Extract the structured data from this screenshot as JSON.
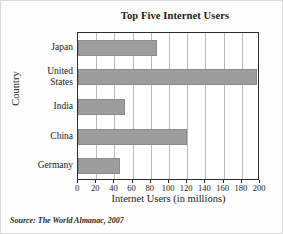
{
  "chart_data": {
    "type": "bar",
    "orientation": "horizontal",
    "title": "Top Five Internet Users",
    "xlabel": "Internet Users (in millions)",
    "ylabel": "Country",
    "categories": [
      "Japan",
      "United States",
      "India",
      "China",
      "Germany"
    ],
    "values": [
      87,
      197,
      52,
      120,
      46
    ],
    "xlim": [
      0,
      200
    ],
    "xticks": [
      0,
      20,
      40,
      60,
      80,
      100,
      120,
      140,
      160,
      180,
      200
    ],
    "xtick_labels": [
      "0",
      "20",
      "40",
      "60",
      "80",
      "100",
      "120",
      "140",
      "160",
      "180",
      "200"
    ],
    "grid": "vertical",
    "legend": "none",
    "bar_color": "#9d9d9d",
    "axis_color": "#2b2b2b",
    "gridline_color": "#b9b9b9"
  },
  "source": {
    "note": "Source: The World Almanac, 2007"
  }
}
